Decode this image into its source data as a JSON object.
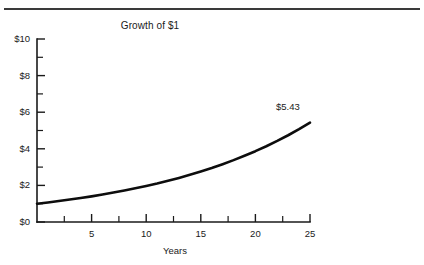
{
  "figure": {
    "top_rule_present": true
  },
  "chart_data": {
    "type": "line",
    "title": "Growth of $1",
    "xlabel": "Years",
    "ylabel": "",
    "xlim": [
      0,
      25
    ],
    "ylim": [
      0,
      10
    ],
    "grid": false,
    "legend": "none",
    "x_tick_labels": [
      "5",
      "10",
      "15",
      "20",
      "25"
    ],
    "x_tick_values": [
      5,
      10,
      15,
      20,
      25
    ],
    "x_minor_tick_values": [
      2.5,
      7.5,
      12.5,
      17.5,
      22.5
    ],
    "y_tick_labels": [
      "$0",
      "$2",
      "$4",
      "$6",
      "$8",
      "$10"
    ],
    "y_tick_values": [
      0,
      2,
      4,
      6,
      8,
      10
    ],
    "y_minor_tick_values": [
      1,
      3,
      5,
      7,
      9
    ],
    "series": [
      {
        "name": "Growth of $1",
        "x": [
          0,
          1,
          2,
          3,
          4,
          5,
          6,
          7,
          8,
          9,
          10,
          11,
          12,
          13,
          14,
          15,
          16,
          17,
          18,
          19,
          20,
          21,
          22,
          23,
          24,
          25
        ],
        "values": [
          1.0,
          1.07,
          1.15,
          1.23,
          1.31,
          1.4,
          1.5,
          1.61,
          1.72,
          1.84,
          1.97,
          2.1,
          2.25,
          2.41,
          2.58,
          2.76,
          2.95,
          3.16,
          3.38,
          3.62,
          3.87,
          4.14,
          4.43,
          4.74,
          5.07,
          5.43
        ]
      }
    ],
    "annotations": [
      {
        "text": "$5.43",
        "x": 25,
        "y": 5.43
      }
    ]
  }
}
